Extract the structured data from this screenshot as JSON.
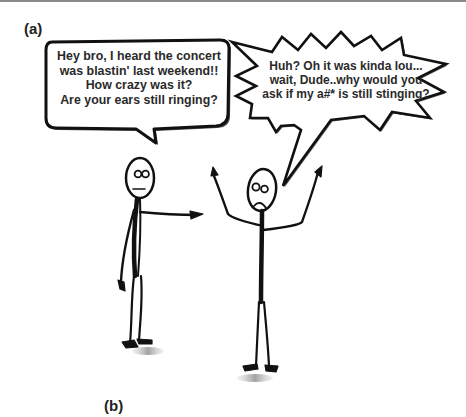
{
  "panels": {
    "a_label": "(a)",
    "b_label": "(b)"
  },
  "bubbles": {
    "left": {
      "type": "speech",
      "speaker": "left-figure",
      "lines": [
        "Hey bro, I heard the concert",
        "was blastin' last weekend!!",
        "How crazy was it?",
        "Are your ears still ringing?"
      ]
    },
    "right": {
      "type": "shout",
      "speaker": "right-figure",
      "lines": [
        "Huh? Oh it was kinda lou...",
        "wait, Dude..why would you",
        "ask if my a#* is still stinging?"
      ]
    }
  },
  "figures": {
    "left": {
      "expression": "neutral",
      "pose": "pointing"
    },
    "right": {
      "expression": "frown",
      "pose": "arms-raised"
    }
  },
  "colors": {
    "ink": "#111111",
    "shadow": "#9a9a9a",
    "rule": "#8a8a8a",
    "background": "#ffffff"
  }
}
